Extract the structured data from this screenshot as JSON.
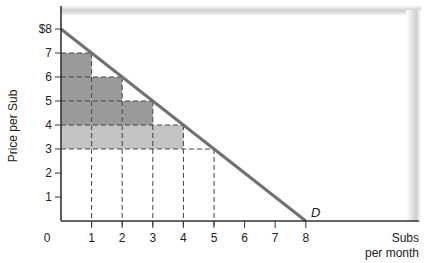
{
  "chart_data": {
    "type": "line",
    "title": "",
    "xlabel": "Subs per month",
    "xlabel_lines": [
      "Subs",
      "per month"
    ],
    "ylabel": "Price per Sub",
    "xlim": [
      0,
      8
    ],
    "ylim": [
      0,
      8
    ],
    "x_ticks": [
      "0",
      "1",
      "2",
      "3",
      "4",
      "5",
      "6",
      "7",
      "8"
    ],
    "y_ticks": [
      "1",
      "2",
      "3",
      "4",
      "5",
      "6",
      "7",
      "$8"
    ],
    "grid": false,
    "series": [
      {
        "name": "D",
        "label": "D",
        "kind": "demand-line",
        "points": [
          [
            0,
            8
          ],
          [
            8,
            0
          ]
        ],
        "color": "#707070"
      }
    ],
    "shaded_regions": [
      {
        "name": "consumer-surplus-step-1",
        "x": [
          0,
          1
        ],
        "y": [
          4,
          7
        ],
        "color": "#9a9a9a"
      },
      {
        "name": "consumer-surplus-step-2",
        "x": [
          1,
          2
        ],
        "y": [
          4,
          6
        ],
        "color": "#9a9a9a"
      },
      {
        "name": "consumer-surplus-step-3",
        "x": [
          2,
          3
        ],
        "y": [
          4,
          5
        ],
        "color": "#9a9a9a"
      },
      {
        "name": "price-drop-band",
        "x": [
          0,
          4
        ],
        "y": [
          3,
          4
        ],
        "color": "#c4c4c4"
      }
    ],
    "step_heights": [
      {
        "x": 1,
        "price": 7
      },
      {
        "x": 2,
        "price": 6
      },
      {
        "x": 3,
        "price": 5
      },
      {
        "x": 4,
        "price": 4
      },
      {
        "x": 5,
        "price": 3
      }
    ],
    "reference_lines": {
      "horizontal_dashed": [
        {
          "y": 7,
          "x_to": 1
        },
        {
          "y": 6,
          "x_to": 2
        },
        {
          "y": 5,
          "x_to": 3
        },
        {
          "y": 4,
          "x_to": 4
        },
        {
          "y": 3,
          "x_to": 5
        }
      ],
      "vertical_dashed": [
        {
          "x": 1,
          "y_from": 7
        },
        {
          "x": 2,
          "y_from": 6
        },
        {
          "x": 3,
          "y_from": 5
        },
        {
          "x": 4,
          "y_from": 4
        },
        {
          "x": 5,
          "y_from": 3
        }
      ]
    },
    "annotations": [
      "D"
    ]
  },
  "axes": {
    "y_title": "Price per Sub",
    "x_title_line1": "Subs",
    "x_title_line2": "per month",
    "origin_label": "0",
    "curve_label": "D"
  },
  "colors": {
    "dark_fill": "#9a9a9a",
    "light_fill": "#c4c4c4",
    "line": "#707070",
    "axis": "#333333",
    "frame_shadow": "#d6d6d6"
  }
}
